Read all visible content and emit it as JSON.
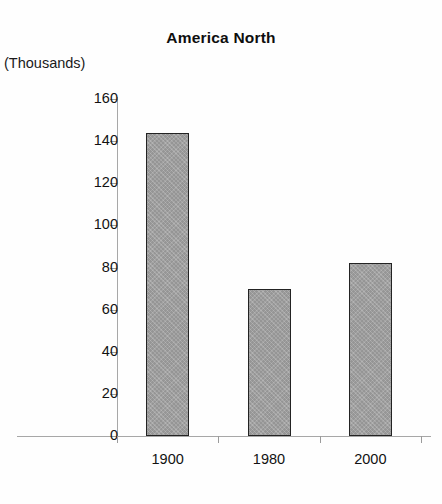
{
  "chart_data": {
    "type": "bar",
    "title": "America North",
    "xlabel": "",
    "ylabel": "(Thousands)",
    "categories": [
      "1900",
      "1980",
      "2000"
    ],
    "values": [
      144,
      70,
      82
    ],
    "ylim": [
      0,
      160
    ],
    "ytick_labels": [
      "160",
      "140",
      "120",
      "100",
      "80",
      "60",
      "40",
      "20",
      "0"
    ],
    "ytick_values": [
      160,
      140,
      120,
      100,
      80,
      60,
      40,
      20,
      0
    ],
    "grid": false,
    "legend": false,
    "legend_position": "none",
    "bar_fill_color": "#a2a2a2",
    "bar_border_color": "#232323",
    "axis_color": "#a7a7a7",
    "text_color": "#121212",
    "background_color": "#fefefe"
  }
}
